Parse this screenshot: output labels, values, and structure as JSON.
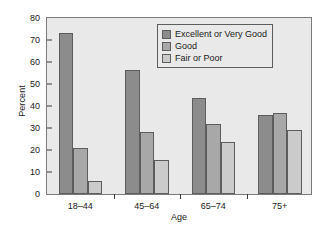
{
  "chart_data": {
    "type": "bar",
    "title": "",
    "xlabel": "Age",
    "ylabel": "Percent",
    "categories": [
      "18–44",
      "45–64",
      "65–74",
      "75+"
    ],
    "series": [
      {
        "name": "Excellent or Very Good",
        "color": "#8c8c8c",
        "values": [
          73,
          56.5,
          43.5,
          36
        ]
      },
      {
        "name": "Good",
        "color": "#a8a8a8",
        "values": [
          21,
          28,
          32,
          37
        ]
      },
      {
        "name": "Fair or Poor",
        "color": "#cbcbcb",
        "values": [
          6,
          15.5,
          23.5,
          29
        ]
      }
    ],
    "ylim": [
      0,
      80
    ],
    "yticks": [
      0,
      10,
      20,
      30,
      40,
      50,
      60,
      70,
      80
    ],
    "ytick_labels": [
      "0",
      "10",
      "20",
      "30",
      "40",
      "50",
      "60",
      "70",
      "80"
    ],
    "grid": false,
    "legend_position": "top-right",
    "plot_background": "#e9e9e9",
    "axis_color": "#7b7b7b",
    "bar_edge_color": "#5d5d5d"
  }
}
